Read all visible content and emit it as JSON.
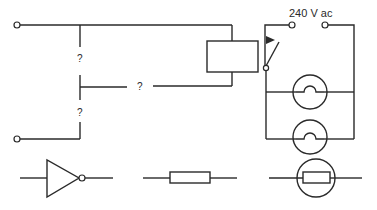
{
  "diagram": {
    "supply_label": "240 V ac",
    "unknown_marks": [
      "?",
      "?",
      "?"
    ],
    "components": {
      "relay": "relay-coil",
      "switch": "relay-contact-switch",
      "lamps": [
        "lamp-1",
        "lamp-2"
      ],
      "symbols_row": [
        "not-gate",
        "resistor",
        "light-dependent-resistor"
      ]
    },
    "colors": {
      "line": "#2a2a2a",
      "background": "#ffffff"
    }
  }
}
